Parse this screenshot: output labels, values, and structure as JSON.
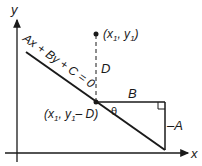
{
  "diagram": {
    "axes": {
      "x_label": "x",
      "y_label": "y"
    },
    "line_equation": "Ax + By + C = 0",
    "point": {
      "label_prefix": "(x",
      "sub1": "1",
      "mid": ", y",
      "sub2": "1",
      "suffix": ")"
    },
    "foot_point": {
      "label_prefix": "(x",
      "sub1": "1",
      "mid": ", y",
      "sub2": "1",
      "suffix": "– D)"
    },
    "distance_label": "D",
    "horizontal_leg_label": "B",
    "vertical_leg_label": "–A",
    "angle_label": "θ",
    "colors": {
      "stroke": "#1a1a1a",
      "background": "#ffffff"
    }
  }
}
